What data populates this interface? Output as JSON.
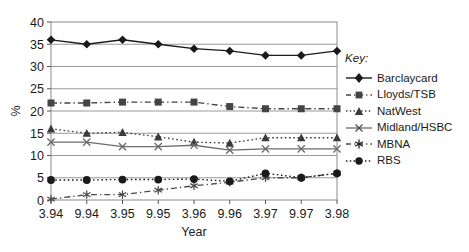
{
  "chart_data": {
    "type": "line",
    "title": "",
    "subtitle": "",
    "xlabel": "Year",
    "ylabel": "%",
    "categories": [
      "3.94",
      "9.94",
      "3.95",
      "9.95",
      "3.96",
      "9.96",
      "3.97",
      "9.97",
      "3.98"
    ],
    "xticklabels": [
      "3.94",
      "9.94",
      "3.95",
      "9.95",
      "3.96",
      "9.96",
      "3.97",
      "9.97",
      "3.98"
    ],
    "yticklabels": [
      "0",
      "5",
      "10",
      "15",
      "20",
      "25",
      "30",
      "35",
      "40"
    ],
    "ylim": [
      0,
      40
    ],
    "ytick_step": 5,
    "grid": "horizontal",
    "legend_position": "right",
    "legend_title": "Key:",
    "series": [
      {
        "name": "Barclaycard",
        "marker": "diamond",
        "line": "solid",
        "color": "#1a1a1a",
        "values": [
          36.0,
          35.0,
          36.0,
          35.0,
          34.0,
          33.5,
          32.5,
          32.5,
          33.5
        ]
      },
      {
        "name": "Lloyds/TSB",
        "marker": "square",
        "line": "dash-dot",
        "color": "#444444",
        "values": [
          21.8,
          21.8,
          22.0,
          22.0,
          22.0,
          21.0,
          20.5,
          20.5,
          20.5
        ]
      },
      {
        "name": "NatWest",
        "marker": "triangle",
        "line": "dotted",
        "color": "#3a3a3a",
        "values": [
          16.0,
          15.0,
          15.2,
          14.2,
          13.0,
          12.8,
          14.0,
          14.0,
          14.0
        ]
      },
      {
        "name": "Midland/HSBC",
        "marker": "x",
        "line": "solid",
        "color": "#6b6b6b",
        "values": [
          13.0,
          13.0,
          12.0,
          12.0,
          12.3,
          11.2,
          11.5,
          11.5,
          11.5
        ]
      },
      {
        "name": "MBNA",
        "marker": "asterisk",
        "line": "dash-dot",
        "color": "#4a4a4a",
        "values": [
          0.2,
          1.2,
          1.2,
          2.2,
          3.2,
          4.0,
          5.0,
          5.0,
          6.0
        ]
      },
      {
        "name": "RBS",
        "marker": "circle",
        "line": "dotted",
        "color": "#1a1a1a",
        "values": [
          4.5,
          4.5,
          4.6,
          4.6,
          4.7,
          4.2,
          6.0,
          5.0,
          6.0
        ]
      }
    ]
  },
  "legend": {
    "title": "Key:",
    "items": [
      {
        "label": "Barclaycard"
      },
      {
        "label": "Lloyds/TSB"
      },
      {
        "label": "NatWest"
      },
      {
        "label": "Midland/HSBC"
      },
      {
        "label": "MBNA"
      },
      {
        "label": "RBS"
      }
    ]
  },
  "axes": {
    "y_title": "%",
    "x_title": "Year"
  }
}
